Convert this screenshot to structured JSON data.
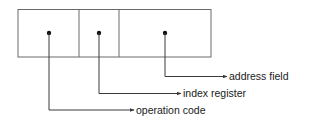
{
  "diagram": {
    "fields": [
      {
        "name": "operation code",
        "x0": 18,
        "x1": 79,
        "dot_x": 49
      },
      {
        "name": "index register",
        "x0": 79,
        "x1": 119,
        "dot_x": 99
      },
      {
        "name": "address field",
        "x0": 119,
        "x1": 211,
        "dot_x": 165
      }
    ],
    "labels": {
      "address_field": "address field",
      "index_register": "index register",
      "operation_code": "operation code"
    },
    "colors": {
      "line": "#3a3a3a",
      "text": "#1a1a1a",
      "background": "#ffffff"
    }
  }
}
